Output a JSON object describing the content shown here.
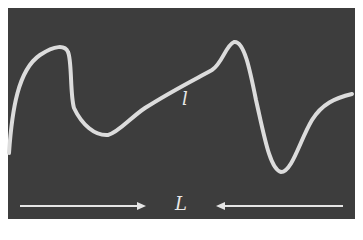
{
  "diagram": {
    "background_color": "#3d3d3d",
    "curve_color": "#dcdcdc",
    "curve_label": "l",
    "length_label": "L",
    "arrows": [
      {
        "direction": "right",
        "from_x": 20,
        "to_x": 145
      },
      {
        "direction": "left",
        "from_x": 343,
        "to_x": 217
      }
    ]
  }
}
